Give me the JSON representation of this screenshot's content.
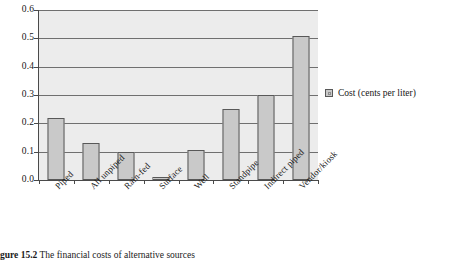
{
  "figure": {
    "caption_number": "gure 15.2",
    "caption_text": "The financial costs of alternative sources"
  },
  "legend": {
    "position": "right",
    "swatch_name": "cost-series-swatch",
    "label": "Cost (cents per liter)"
  },
  "axis": {
    "y_ticks": [
      "0.0",
      "0.1",
      "0.2",
      "0.3",
      "0.4",
      "0.5",
      "0.6"
    ]
  },
  "colors": {
    "bar_fill": "#c9c9c9",
    "bar_stroke": "#585858",
    "plot_background": "#ececec",
    "gridline": "#6f6f6f",
    "axis": "#4a4a4a",
    "text": "#161616"
  },
  "chart_data": {
    "type": "bar",
    "title": "The financial costs of alternative sources",
    "xlabel": "",
    "ylabel": "",
    "ylim": [
      0.0,
      0.6
    ],
    "ytick_step": 0.1,
    "grid": true,
    "legend_position": "right",
    "categories": [
      "Piped",
      "All unpiped",
      "Rain-fed",
      "Surface",
      "Well",
      "Standpipe",
      "Indirect piped",
      "Vendor/kiosk"
    ],
    "series": [
      {
        "name": "Cost (cents per liter)",
        "values": [
          0.22,
          0.13,
          0.1,
          0.012,
          0.105,
          0.25,
          0.3,
          0.51
        ]
      }
    ]
  }
}
